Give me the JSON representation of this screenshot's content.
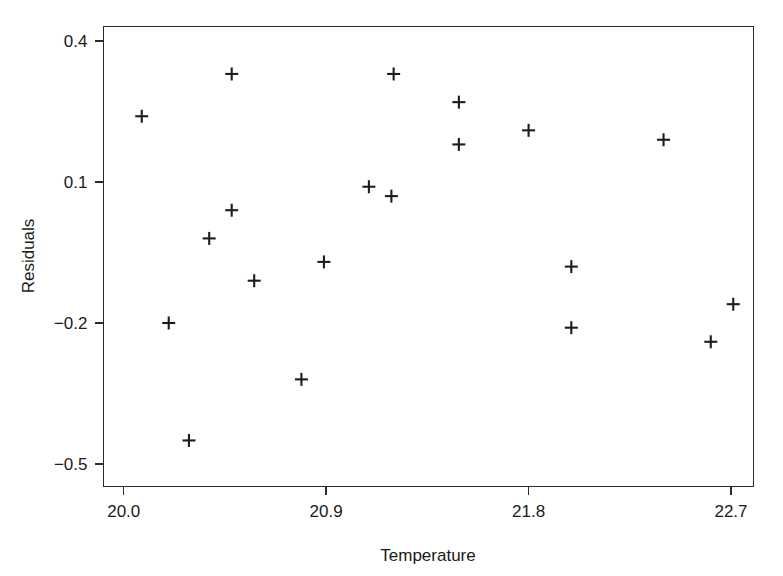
{
  "chart_data": {
    "type": "scatter",
    "title": "",
    "xlabel": "Temperature",
    "ylabel": "Residuals",
    "xlim": [
      19.91,
      22.8
    ],
    "ylim": [
      -0.548,
      0.431
    ],
    "grid": false,
    "legend": null,
    "marker": "plus",
    "marker_color": "#1c1c1c",
    "xticks": [
      20.0,
      20.9,
      21.8,
      22.7
    ],
    "xticklabels": [
      "20.0",
      "20.9",
      "21.8",
      "22.7"
    ],
    "yticks": [
      0.4,
      0.1,
      -0.2,
      -0.5
    ],
    "yticklabels": [
      "0.4",
      "0.1",
      "-0.2",
      "-0.5"
    ],
    "points": [
      {
        "x": 20.08,
        "y": 0.24
      },
      {
        "x": 20.48,
        "y": 0.33
      },
      {
        "x": 20.48,
        "y": 0.04
      },
      {
        "x": 20.38,
        "y": -0.02
      },
      {
        "x": 20.58,
        "y": -0.11
      },
      {
        "x": 20.2,
        "y": -0.2
      },
      {
        "x": 20.29,
        "y": -0.45
      },
      {
        "x": 20.79,
        "y": -0.32
      },
      {
        "x": 20.89,
        "y": -0.07
      },
      {
        "x": 21.09,
        "y": 0.09
      },
      {
        "x": 21.19,
        "y": 0.07
      },
      {
        "x": 21.2,
        "y": 0.33
      },
      {
        "x": 21.49,
        "y": 0.27
      },
      {
        "x": 21.49,
        "y": 0.18
      },
      {
        "x": 21.8,
        "y": 0.21
      },
      {
        "x": 22.4,
        "y": 0.19
      },
      {
        "x": 21.99,
        "y": -0.08
      },
      {
        "x": 21.99,
        "y": -0.21
      },
      {
        "x": 22.61,
        "y": -0.24
      },
      {
        "x": 22.71,
        "y": -0.16
      }
    ],
    "point_count": 20,
    "axis_color": "#2b2b2b",
    "background_color": "#ffffff"
  },
  "labels": {
    "x_axis_title": "Temperature",
    "y_axis_title": "Residuals"
  }
}
